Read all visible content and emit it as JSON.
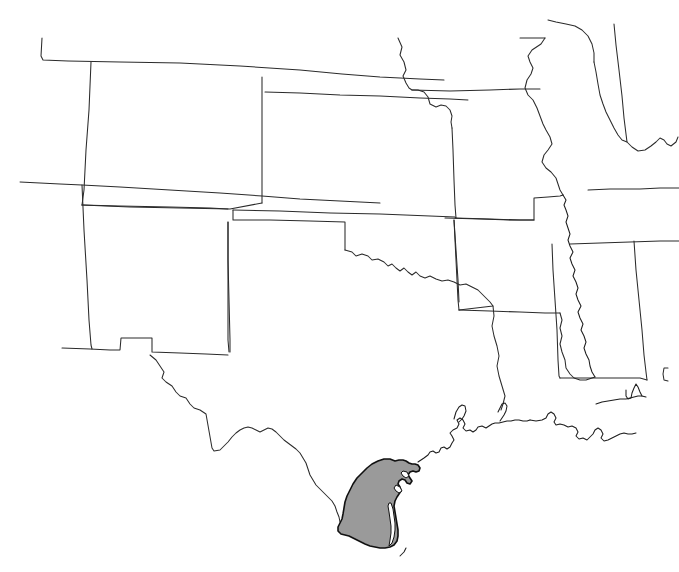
{
  "figure": {
    "kind": "range-distribution-map",
    "title": "",
    "region_description": "South-central United States",
    "background_color": "#ffffff",
    "width": 679,
    "height": 572
  },
  "style": {
    "state_border_color": "#2b2b2b",
    "coastline_color": "#1d1d1d",
    "range_fill_color": "#9a9a9a",
    "range_outline_color": "#111111",
    "lagoon_fill_color": "#ffffff",
    "border_width_px": 1.05,
    "range_border_width_px": 1.6
  },
  "legend": {
    "present": false,
    "entries": [
      {
        "label": "Shaded range",
        "color": "#9a9a9a"
      }
    ]
  },
  "range": {
    "name": "shaded-distribution-area",
    "location": "South Texas Gulf coastal plain",
    "fill": "#9a9a9a",
    "approximate_extent": {
      "north_px": 459,
      "south_px": 549,
      "west_px": 338,
      "east_px": 420
    }
  },
  "states": [
    {
      "id": "colorado",
      "name": "Colorado",
      "shaded": false
    },
    {
      "id": "kansas",
      "name": "Kansas",
      "shaded": false
    },
    {
      "id": "nebraska",
      "name": "Nebraska",
      "shaded": false
    },
    {
      "id": "missouri",
      "name": "Missouri",
      "shaded": false
    },
    {
      "id": "iowa",
      "name": "Iowa",
      "shaded": false
    },
    {
      "id": "illinois",
      "name": "Illinois",
      "shaded": false
    },
    {
      "id": "indiana",
      "name": "Indiana",
      "shaded": false
    },
    {
      "id": "kentucky",
      "name": "Kentucky",
      "shaded": false
    },
    {
      "id": "tennessee",
      "name": "Tennessee",
      "shaded": false
    },
    {
      "id": "arkansas",
      "name": "Arkansas",
      "shaded": false
    },
    {
      "id": "oklahoma",
      "name": "Oklahoma",
      "shaded": false
    },
    {
      "id": "new-mexico",
      "name": "New Mexico",
      "shaded": false
    },
    {
      "id": "arizona",
      "name": "Arizona",
      "shaded": false
    },
    {
      "id": "utah",
      "name": "Utah",
      "shaded": false
    },
    {
      "id": "texas",
      "name": "Texas",
      "shaded": true
    },
    {
      "id": "louisiana",
      "name": "Louisiana",
      "shaded": false
    },
    {
      "id": "mississippi",
      "name": "Mississippi",
      "shaded": false
    },
    {
      "id": "alabama",
      "name": "Alabama",
      "shaded": false
    },
    {
      "id": "florida",
      "name": "Florida",
      "shaded": false
    }
  ],
  "annotations": {
    "labels_shown": false,
    "scale_bar_shown": false,
    "north_arrow_shown": false,
    "graticule_shown": false
  }
}
